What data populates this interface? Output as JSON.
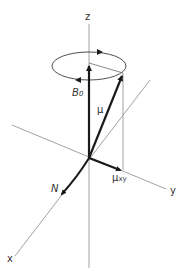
{
  "diagram": {
    "title": "",
    "labels": {
      "z_axis": "z",
      "x_axis": "x",
      "y_axis": "y",
      "b0": "B",
      "b0_sub": "0",
      "mu": "μ",
      "mu_xy": "μ",
      "mu_xy_sub": "xy",
      "n": "N"
    },
    "colors": {
      "axis": "#8a8a8a",
      "vector": "#1a1a1a",
      "text": "#333333",
      "background": "#ffffff"
    }
  }
}
